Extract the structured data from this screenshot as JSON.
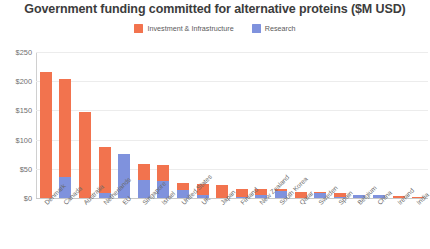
{
  "chart_data": {
    "type": "bar",
    "subtype": "stacked-bar",
    "title": "Government funding committed for alternative proteins ($M USD)",
    "xlabel": "",
    "ylabel": "",
    "ylim": [
      0,
      250
    ],
    "ytick_labels": [
      "$0",
      "$50",
      "$100",
      "$150",
      "$200",
      "$250"
    ],
    "ytick_values": [
      0,
      50,
      100,
      150,
      200,
      250
    ],
    "grid": true,
    "legend_position": "top-center",
    "categories": [
      "Denmark",
      "Canada",
      "Australia",
      "Netherlands",
      "EU",
      "Singapore",
      "Israel",
      "United States",
      "UK",
      "Japan",
      "Finland",
      "New Zealand",
      "South Korea",
      "Qatar",
      "Sweden",
      "Spain",
      "Belgium",
      "China",
      "Ireland",
      "India"
    ],
    "series": [
      {
        "name": "Investment & Infrastructure",
        "color": "#F2734E",
        "values": [
          216,
          168,
          148,
          80,
          0,
          27,
          28,
          11,
          19,
          22,
          14,
          11,
          4,
          11,
          2,
          8,
          0,
          0,
          4,
          1
        ]
      },
      {
        "name": "Research",
        "color": "#7F92DD",
        "values": [
          0,
          36,
          0,
          8,
          76,
          31,
          29,
          14,
          5,
          0,
          2,
          5,
          12,
          0,
          9,
          1,
          6,
          6,
          0,
          0
        ]
      }
    ],
    "totals": [
      216,
      204,
      148,
      88,
      76,
      58,
      57,
      25,
      24,
      22,
      16,
      16,
      16,
      11,
      11,
      9,
      6,
      6,
      4,
      1
    ]
  },
  "legend": {
    "items": [
      {
        "label": "Investment & Infrastructure",
        "color": "#F2734E"
      },
      {
        "label": "Research",
        "color": "#7F92DD"
      }
    ]
  },
  "colors": {
    "investment": "#F2734E",
    "research": "#7F92DD",
    "grid": "#ececec",
    "axis": "#c8c8c8",
    "text": "#3c3c3c"
  }
}
